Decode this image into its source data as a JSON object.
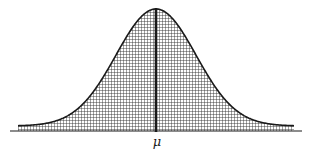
{
  "figure": {
    "type": "normal-distribution-curve",
    "mean_label": "μ",
    "colors": {
      "background": "#ffffff",
      "ink": "#1a1a1a",
      "hatch": "#333333"
    },
    "geometry": {
      "baseline_y": 131,
      "baseline_x_start": 10,
      "baseline_x_end": 302,
      "shade_x_start": 18,
      "shade_x_end": 294,
      "tail_y": 126,
      "peak_x": 156,
      "peak_y": 9,
      "sigma_px": 40,
      "hatch_spacing": 3
    }
  }
}
